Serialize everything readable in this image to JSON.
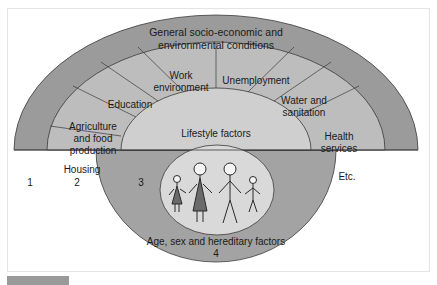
{
  "diagram": {
    "colors": {
      "outer_ring": "#9b9b9b",
      "ring2": "#bdbdbd",
      "ring3": "#cfcfcf",
      "ring4_lower": "#a3a3a3",
      "inner_oval": "#d9d9d9",
      "stroke": "#3a3a3a",
      "figure_dress": "#6a6a6a"
    },
    "layers": {
      "layer1": {
        "line1": "General socio-economic and",
        "line2": "environmental conditions",
        "number": "1"
      },
      "layer2": {
        "number": "2",
        "segments": [
          {
            "line1": "Housing",
            "line2": ""
          },
          {
            "line1": "Agriculture",
            "line2": "and food",
            "line3": "production"
          },
          {
            "line1": "Education",
            "line2": ""
          },
          {
            "line1": "Work",
            "line2": "environment"
          },
          {
            "line1": "Unemployment",
            "line2": ""
          },
          {
            "line1": "Water and",
            "line2": "sanitation"
          },
          {
            "line1": "Health",
            "line2": "services"
          },
          {
            "line1": "Etc.",
            "line2": ""
          }
        ]
      },
      "layer3": {
        "label": "Lifestyle factors",
        "number": "3"
      },
      "layer4": {
        "label": "Age, sex and hereditary factors",
        "number": "4"
      }
    }
  }
}
